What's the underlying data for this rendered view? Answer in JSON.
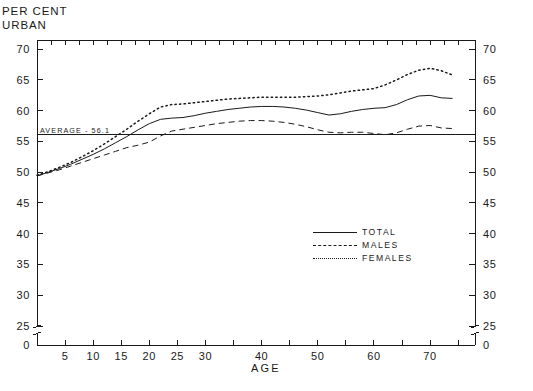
{
  "title": {
    "line1": "PER CENT",
    "line2": "URBAN"
  },
  "axes": {
    "x_label": "AGE",
    "x_ticks": [
      "5",
      "10",
      "15",
      "20",
      "25",
      "30",
      "40",
      "50",
      "60",
      "70"
    ],
    "y_ticks": [
      "70",
      "65",
      "60",
      "55",
      "50",
      "45",
      "40",
      "35",
      "30",
      "25",
      "0"
    ],
    "y_ticks_right": [
      "70",
      "65",
      "60",
      "55",
      "50",
      "45",
      "40",
      "35",
      "30",
      "25",
      "0"
    ]
  },
  "annotation": {
    "average_label": "AVERAGE - 56.1"
  },
  "legend": {
    "items": [
      {
        "label": "TOTAL",
        "style": "solid"
      },
      {
        "label": "MALES",
        "style": "dashed"
      },
      {
        "label": "FEMALES",
        "style": "dotted"
      }
    ]
  },
  "chart_data": {
    "type": "line",
    "xlabel": "AGE",
    "ylabel": "PER CENT URBAN",
    "xlim": [
      0,
      78
    ],
    "ylim": [
      24,
      72
    ],
    "grid": false,
    "legend_position": "center-right",
    "axis_break_y": [
      0,
      25
    ],
    "reference_line": {
      "label": "AVERAGE - 56.1",
      "value": 56.1
    },
    "x": [
      0,
      2,
      4,
      6,
      8,
      10,
      12,
      14,
      16,
      18,
      20,
      22,
      24,
      26,
      28,
      30,
      32,
      34,
      36,
      38,
      40,
      42,
      44,
      46,
      48,
      50,
      52,
      54,
      56,
      58,
      60,
      62,
      64,
      66,
      68,
      70,
      72,
      74
    ],
    "series": [
      {
        "name": "TOTAL",
        "style": "solid",
        "values": [
          49.4,
          50.0,
          50.6,
          51.3,
          52.1,
          52.9,
          53.8,
          54.8,
          55.8,
          56.9,
          57.9,
          58.6,
          58.8,
          58.9,
          59.2,
          59.6,
          59.9,
          60.2,
          60.4,
          60.6,
          60.7,
          60.7,
          60.6,
          60.4,
          60.1,
          59.7,
          59.3,
          59.5,
          59.9,
          60.2,
          60.4,
          60.5,
          61.0,
          61.8,
          62.4,
          62.5,
          62.1,
          62.0
        ]
      },
      {
        "name": "MALES",
        "style": "dashed",
        "values": [
          49.4,
          49.9,
          50.4,
          51.0,
          51.6,
          52.2,
          52.8,
          53.4,
          54.0,
          54.4,
          54.9,
          55.9,
          56.7,
          57.0,
          57.3,
          57.6,
          57.9,
          58.1,
          58.3,
          58.4,
          58.4,
          58.3,
          58.1,
          57.8,
          57.4,
          56.9,
          56.5,
          56.4,
          56.5,
          56.5,
          56.3,
          56.1,
          56.4,
          57.0,
          57.5,
          57.6,
          57.2,
          57.1
        ]
      },
      {
        "name": "FEMALES",
        "style": "dotted",
        "values": [
          49.5,
          50.1,
          50.8,
          51.6,
          52.5,
          53.5,
          54.6,
          55.8,
          57.0,
          58.3,
          59.5,
          60.6,
          61.0,
          61.1,
          61.3,
          61.5,
          61.7,
          61.9,
          62.0,
          62.1,
          62.2,
          62.2,
          62.2,
          62.2,
          62.3,
          62.4,
          62.6,
          62.9,
          63.2,
          63.4,
          63.6,
          64.2,
          65.0,
          65.9,
          66.6,
          66.9,
          66.5,
          65.8
        ]
      }
    ]
  }
}
